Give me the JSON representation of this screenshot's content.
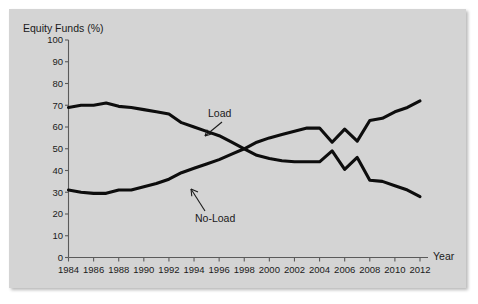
{
  "chart_data": {
    "type": "line",
    "title": "Equity Funds (%)",
    "xlabel": "Year",
    "ylabel": "Equity Funds (%)",
    "xlim": [
      1984,
      2012
    ],
    "ylim": [
      0,
      100
    ],
    "grid": false,
    "legend_position": "inline-annotations",
    "x": [
      1984,
      1985,
      1986,
      1987,
      1988,
      1989,
      1990,
      1991,
      1992,
      1993,
      1994,
      1995,
      1996,
      1997,
      1998,
      1999,
      2000,
      2001,
      2002,
      2003,
      2004,
      2005,
      2006,
      2007,
      2008,
      2009,
      2010,
      2011,
      2012
    ],
    "xticks": [
      "1984",
      "1986",
      "1988",
      "1990",
      "1992",
      "1994",
      "1996",
      "1998",
      "2000",
      "2002",
      "2004",
      "2006",
      "2008",
      "2010",
      "2012"
    ],
    "yticks": [
      "0",
      "10",
      "20",
      "30",
      "40",
      "50",
      "60",
      "70",
      "80",
      "90",
      "100"
    ],
    "series": [
      {
        "name": "Load",
        "values": [
          69,
          70,
          70,
          71,
          69.5,
          69,
          68,
          67,
          66,
          62,
          60,
          58,
          56,
          53,
          50,
          47,
          45.5,
          44.5,
          44,
          44,
          44,
          49,
          40.5,
          46,
          35.5,
          35,
          33,
          31,
          28
        ]
      },
      {
        "name": "No-Load",
        "values": [
          31,
          30,
          29.5,
          29.5,
          31,
          31,
          32.5,
          34,
          36,
          39,
          41,
          43,
          45,
          47.5,
          50,
          53,
          55,
          56.5,
          58,
          59.5,
          59.5,
          53,
          59,
          53.5,
          63,
          64,
          67,
          69,
          72
        ]
      }
    ],
    "annotations": [
      {
        "text": "Load",
        "points_to_series": "Load"
      },
      {
        "text": "No-Load",
        "points_to_series": "No-Load"
      }
    ]
  }
}
